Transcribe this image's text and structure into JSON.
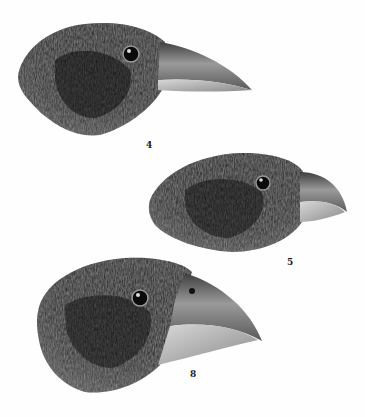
{
  "plate": {
    "subject": "Illustration plate of three finch heads",
    "figures": [
      {
        "id": "fig-4",
        "label": "4",
        "label_pos": [
          146,
          140
        ]
      },
      {
        "id": "fig-5",
        "label": "5",
        "label_pos": [
          287,
          257
        ]
      },
      {
        "id": "fig-8",
        "label": "8",
        "label_pos": [
          190,
          369
        ]
      }
    ]
  },
  "colors": {
    "background": "#fefefe",
    "plumage_dark": "#1a1a1a",
    "plumage_mid": "#3a3a3a",
    "plumage_light": "#6a6a6a",
    "beak_dark": "#4a4a4a",
    "beak_light": "#bdbdbd",
    "label": "#222222"
  }
}
